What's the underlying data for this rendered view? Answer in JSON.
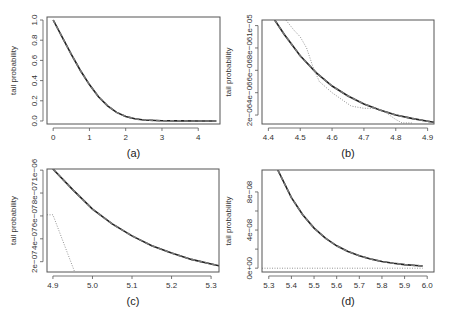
{
  "figure": {
    "panel_count": 4,
    "colors": {
      "frame": "#555555",
      "solid": "#222222",
      "dashed": "#777777",
      "dotted": "#888888",
      "text": "#333333"
    }
  },
  "chart_data": [
    {
      "id": "a",
      "type": "line",
      "caption": "(a)",
      "title": "",
      "xlabel": "",
      "ylabel": "tail probability",
      "xlim": [
        -0.17,
        4.6
      ],
      "ylim": [
        -0.03,
        1.03
      ],
      "xticks": [
        0,
        1,
        2,
        3,
        4
      ],
      "xtick_labels": [
        "0",
        "1",
        "2",
        "3",
        "4"
      ],
      "yticks": [
        0.0,
        0.2,
        0.4,
        0.6,
        0.8,
        1.0
      ],
      "ytick_labels": [
        "0.0",
        "0.2",
        "0.4",
        "0.6",
        "0.8",
        "1.0"
      ],
      "grid": false,
      "legend": null,
      "frame_px": {
        "left": 47,
        "top": 17,
        "right": 220,
        "bottom": 124
      },
      "series": [
        {
          "name": "solid",
          "style": "solid",
          "x": [
            0,
            0.25,
            0.5,
            0.75,
            1.0,
            1.25,
            1.5,
            1.75,
            2.0,
            2.25,
            2.5,
            3.0,
            3.5,
            4.0,
            4.5
          ],
          "y": [
            1.0,
            0.83,
            0.66,
            0.5,
            0.36,
            0.24,
            0.15,
            0.085,
            0.045,
            0.022,
            0.01,
            0.002,
            0.0005,
            0.0001,
            0.0
          ]
        },
        {
          "name": "dashed",
          "style": "dashed",
          "x": [
            0,
            0.25,
            0.5,
            0.75,
            1.0,
            1.25,
            1.5,
            1.75,
            2.0,
            2.25,
            2.5,
            3.0,
            3.5,
            4.0,
            4.5
          ],
          "y": [
            1.0,
            0.83,
            0.66,
            0.5,
            0.36,
            0.24,
            0.15,
            0.085,
            0.045,
            0.022,
            0.01,
            0.002,
            0.0005,
            0.0001,
            0.0
          ]
        }
      ]
    },
    {
      "id": "b",
      "type": "line",
      "caption": "(b)",
      "title": "",
      "xlabel": "",
      "ylabel": "tail probability",
      "xlim": [
        4.38,
        4.92
      ],
      "ylim": [
        1.2e-06,
        1.05e-05
      ],
      "xticks": [
        4.4,
        4.5,
        4.6,
        4.7,
        4.8,
        4.9
      ],
      "xtick_labels": [
        "4.4",
        "4.5",
        "4.6",
        "4.7",
        "4.8",
        "4.9"
      ],
      "yticks": [
        2e-06,
        4e-06,
        6e-06,
        8e-06,
        1e-05
      ],
      "ytick_labels": [
        "2e−06",
        "4e−06",
        "6e−06",
        "8e−06",
        "1e−05"
      ],
      "grid": false,
      "legend": null,
      "frame_px": {
        "left": 262,
        "top": 20,
        "right": 434,
        "bottom": 124
      },
      "series": [
        {
          "name": "solid",
          "style": "solid",
          "x": [
            4.42,
            4.45,
            4.5,
            4.55,
            4.6,
            4.65,
            4.7,
            4.75,
            4.8,
            4.85,
            4.9,
            4.92
          ],
          "y": [
            1.05e-05,
            9.2e-06,
            7.3e-06,
            5.8e-06,
            4.6e-06,
            3.7e-06,
            3e-06,
            2.45e-06,
            2e-06,
            1.7e-06,
            1.45e-06,
            1.35e-06
          ]
        },
        {
          "name": "dashed",
          "style": "dashed",
          "x": [
            4.42,
            4.45,
            4.5,
            4.55,
            4.6,
            4.65,
            4.7,
            4.75,
            4.8,
            4.85,
            4.9,
            4.92
          ],
          "y": [
            1.05e-05,
            9.2e-06,
            7.3e-06,
            5.8e-06,
            4.6e-06,
            3.7e-06,
            3e-06,
            2.45e-06,
            2e-06,
            1.7e-06,
            1.45e-06,
            1.35e-06
          ]
        },
        {
          "name": "dotted",
          "style": "dotted",
          "x": [
            4.455,
            4.48,
            4.5,
            4.52,
            4.54,
            4.56,
            4.6,
            4.63,
            4.66,
            4.7,
            4.74,
            4.77,
            4.8,
            4.82,
            4.85
          ],
          "y": [
            1.05e-05,
            9.6e-06,
            9e-06,
            8e-06,
            6.3e-06,
            5e-06,
            4e-06,
            3.4e-06,
            2.8e-06,
            2.6e-06,
            2.6e-06,
            2.2e-06,
            1.6e-06,
            1.3e-06,
            1.3e-06
          ]
        }
      ]
    },
    {
      "id": "c",
      "type": "line",
      "caption": "(c)",
      "title": "",
      "xlabel": "",
      "ylabel": "tail probability",
      "xlim": [
        4.885,
        5.32
      ],
      "ylim": [
        1.1e-07,
        1.01e-06
      ],
      "xticks": [
        4.9,
        5.0,
        5.1,
        5.2,
        5.3
      ],
      "xtick_labels": [
        "4.9",
        "5.0",
        "5.1",
        "5.2",
        "5.3"
      ],
      "yticks": [
        2e-07,
        4e-07,
        6e-07,
        8e-07,
        1e-06
      ],
      "ytick_labels": [
        "2e−07",
        "4e−07",
        "6e−07",
        "8e−07",
        "1e−06"
      ],
      "grid": false,
      "legend": null,
      "frame_px": {
        "left": 47,
        "top": 169,
        "right": 219,
        "bottom": 272
      },
      "series": [
        {
          "name": "solid",
          "style": "solid",
          "x": [
            4.9,
            4.95,
            5.0,
            5.05,
            5.1,
            5.15,
            5.2,
            5.25,
            5.3,
            5.32
          ],
          "y": [
            1.01e-06,
            8.3e-07,
            6.6e-07,
            5.3e-07,
            4.25e-07,
            3.4e-07,
            2.75e-07,
            2.2e-07,
            1.8e-07,
            1.65e-07
          ]
        },
        {
          "name": "dashed",
          "style": "dashed",
          "x": [
            4.9,
            4.95,
            5.0,
            5.05,
            5.1,
            5.15,
            5.2,
            5.25,
            5.3,
            5.32
          ],
          "y": [
            1.01e-06,
            8.3e-07,
            6.6e-07,
            5.3e-07,
            4.25e-07,
            3.4e-07,
            2.75e-07,
            2.2e-07,
            1.8e-07,
            1.65e-07
          ]
        },
        {
          "name": "dotted",
          "style": "dotted",
          "x": [
            4.885,
            4.9,
            4.955
          ],
          "y": [
            6.1e-07,
            6.1e-07,
            1.1e-07
          ]
        }
      ]
    },
    {
      "id": "d",
      "type": "line",
      "caption": "(d)",
      "title": "",
      "xlabel": "",
      "ylabel": "tail probability",
      "xlim": [
        5.27,
        6.03
      ],
      "ylim": [
        -4e-09,
        1.03e-07
      ],
      "xticks": [
        5.3,
        5.4,
        5.5,
        5.6,
        5.7,
        5.8,
        5.9,
        6.0
      ],
      "xtick_labels": [
        "5.3",
        "5.4",
        "5.5",
        "5.6",
        "5.7",
        "5.8",
        "5.9",
        "6.0"
      ],
      "yticks": [
        0,
        2e-08,
        4e-08,
        6e-08,
        8e-08
      ],
      "ytick_labels": [
        "0e+00",
        "",
        "4e−08",
        "",
        "8e−08"
      ],
      "grid": false,
      "legend": null,
      "frame_px": {
        "left": 262,
        "top": 170,
        "right": 434,
        "bottom": 272
      },
      "series": [
        {
          "name": "solid",
          "style": "solid",
          "x": [
            5.34,
            5.4,
            5.45,
            5.5,
            5.55,
            5.6,
            5.65,
            5.7,
            5.75,
            5.8,
            5.85,
            5.9,
            5.95,
            5.98
          ],
          "y": [
            1.03e-07,
            7.4e-08,
            5.6e-08,
            4.2e-08,
            3.15e-08,
            2.35e-08,
            1.75e-08,
            1.3e-08,
            9.6e-09,
            7e-09,
            5.2e-09,
            3.8e-09,
            2.8e-09,
            2.3e-09
          ]
        },
        {
          "name": "dashed",
          "style": "dashed",
          "x": [
            5.34,
            5.4,
            5.45,
            5.5,
            5.55,
            5.6,
            5.65,
            5.7,
            5.75,
            5.8,
            5.85,
            5.9,
            5.95,
            5.98
          ],
          "y": [
            1.03e-07,
            7.4e-08,
            5.6e-08,
            4.2e-08,
            3.15e-08,
            2.35e-08,
            1.75e-08,
            1.3e-08,
            9.6e-09,
            7e-09,
            5.2e-09,
            3.8e-09,
            2.8e-09,
            2.3e-09
          ]
        },
        {
          "name": "dotted",
          "style": "dotted",
          "x": [
            5.27,
            5.98
          ],
          "y": [
            0,
            0
          ]
        }
      ]
    }
  ]
}
